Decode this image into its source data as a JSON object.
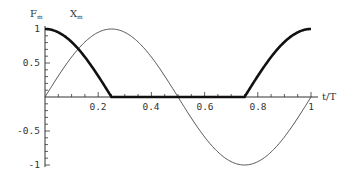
{
  "chart_data": {
    "type": "line",
    "title": "",
    "xlabel": "t/T",
    "ylabel": "",
    "legend_labels": [
      "F_m",
      "X_m"
    ],
    "labels": {
      "F": "F",
      "F_sub": "m",
      "X": "X",
      "X_sub": "m",
      "x_axis": "t/T"
    },
    "xlim": [
      0,
      1
    ],
    "ylim": [
      -1,
      1
    ],
    "x_ticks": [
      "0.2",
      "0.4",
      "0.6",
      "0.8",
      "1"
    ],
    "y_ticks": [
      "1",
      "0.5",
      "-0.5",
      "-1"
    ],
    "grid": false,
    "x": [
      0,
      0.05,
      0.1,
      0.15,
      0.2,
      0.25,
      0.3,
      0.35,
      0.4,
      0.45,
      0.5,
      0.55,
      0.6,
      0.65,
      0.7,
      0.75,
      0.8,
      0.85,
      0.9,
      0.95,
      1.0
    ],
    "series": [
      {
        "name": "F_m",
        "style": "thick",
        "values": [
          1.0,
          0.95,
          0.81,
          0.59,
          0.31,
          0.0,
          0.0,
          0.0,
          0.0,
          0.0,
          0.0,
          0.0,
          0.0,
          0.0,
          0.0,
          0.0,
          0.31,
          0.59,
          0.81,
          0.95,
          1.0
        ]
      },
      {
        "name": "X_m",
        "style": "thin",
        "values": [
          0.0,
          0.31,
          0.59,
          0.81,
          0.95,
          1.0,
          0.95,
          0.81,
          0.59,
          0.31,
          0.0,
          -0.31,
          -0.59,
          -0.81,
          -0.95,
          -1.0,
          -0.95,
          -0.81,
          -0.59,
          -0.31,
          0.0
        ]
      }
    ]
  }
}
